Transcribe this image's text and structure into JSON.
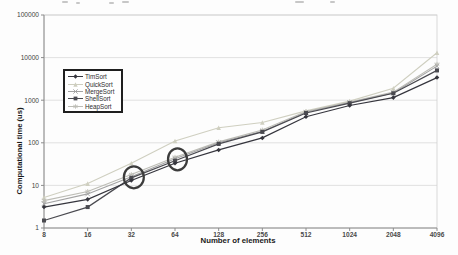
{
  "figure": {
    "kind": "scanned line chart figure",
    "background": "#ffffff"
  },
  "chart_data": {
    "type": "line",
    "title": "",
    "xlabel": "Number of elements",
    "ylabel": "Computational time (us)",
    "x_scale": "log2",
    "y_scale": "log10",
    "x": [
      8,
      16,
      32,
      64,
      128,
      256,
      512,
      1024,
      2048,
      4096
    ],
    "x_tick_labels": [
      "8",
      "16",
      "32",
      "64",
      "128",
      "256",
      "512",
      "1024",
      "2048",
      "4096"
    ],
    "y_tick_labels": [
      "1",
      "10",
      "100",
      "1000",
      "10000",
      "100000"
    ],
    "ylim": [
      1,
      100000
    ],
    "grid": "horizontal-decades",
    "legend_position": "upper-left-inside",
    "series": [
      {
        "name": "TimSort",
        "marker": "diamond",
        "color": "#35353d",
        "width": 1.2,
        "values": [
          3.1,
          4.7,
          13,
          33,
          68,
          130,
          410,
          750,
          1150,
          3400
        ]
      },
      {
        "name": "QuickSort",
        "marker": "triangle",
        "color": "#cfcfc0",
        "width": 1.1,
        "values": [
          5.2,
          11,
          33,
          110,
          225,
          300,
          560,
          950,
          1900,
          13000
        ]
      },
      {
        "name": "MergeSort",
        "marker": "x",
        "color": "#a3a3a3",
        "width": 1.1,
        "values": [
          3.7,
          6.3,
          16,
          42,
          100,
          185,
          520,
          880,
          1480,
          6300
        ]
      },
      {
        "name": "ShellSort",
        "marker": "square",
        "color": "#4a4a50",
        "width": 1.2,
        "values": [
          1.5,
          3.1,
          15,
          38,
          94,
          180,
          500,
          850,
          1450,
          5000
        ]
      },
      {
        "name": "HeapSort",
        "marker": "asterisk",
        "color": "#bdbdb6",
        "width": 1.1,
        "values": [
          4.4,
          7.2,
          18,
          46,
          105,
          200,
          540,
          900,
          1550,
          7000
        ]
      }
    ],
    "annotations": [
      {
        "shape": "ellipse",
        "x": 32,
        "y": 15.5,
        "rx": 10,
        "ry": 11,
        "color": "#3c3c3c"
      },
      {
        "shape": "ellipse",
        "x": 64,
        "y": 41,
        "rx": 9.5,
        "ry": 11,
        "color": "#3c3c3c"
      }
    ],
    "colors": {
      "gridline": "#d9d9d9",
      "plot_border": "#cfcfcf",
      "axis": "#8c8c8c",
      "tick_text": "#3f3f3f",
      "title_text": "#1a1a1a"
    }
  }
}
